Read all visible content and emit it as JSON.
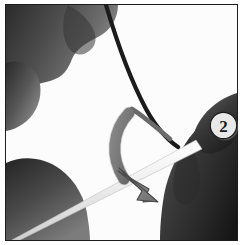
{
  "figure": {
    "kind": "instructional-photograph",
    "alt_text": "Grayscale photo: left hand holds a thin dark wire, right hand grips a light rod; a curved arrow shows the bending direction.",
    "background_color": "#ffffff",
    "frame": {
      "border_color": "#1d1d1d",
      "border_width_px": 1,
      "fill_color": "#fbfbfb"
    }
  },
  "step_badge": {
    "label": "2",
    "shape": "circle",
    "fill_color": "#e8e8e8",
    "outline_color": "#1a1a1a",
    "text_color": "#1a1a1a",
    "shadow_color": "#7d7d7d"
  },
  "direction_arrow": {
    "name": "curved-bend-arrow",
    "style": "curved",
    "sweep": "clockwise",
    "points_toward": "down-right",
    "fill_color": "#8c8c8c",
    "outline_color": "#4a4a4a"
  },
  "objects": [
    {
      "name": "left-hand",
      "tone": "dark-gray",
      "fill_color": "#3a3a3a",
      "position": "upper-left"
    },
    {
      "name": "left-thumb",
      "tone": "dark-gray",
      "fill_color": "#4b4b4b",
      "position": "lower-left"
    },
    {
      "name": "right-hand",
      "tone": "dark-gray",
      "fill_color": "#2f2f2f",
      "position": "lower-right"
    },
    {
      "name": "wire",
      "tone": "near-black",
      "fill_color": "#1c1c1c",
      "description": "thin dark wire descending from top"
    },
    {
      "name": "rod",
      "tone": "white",
      "fill_color": "#f4f4f4",
      "description": "light diagonal rod from lower-left to upper-right"
    }
  ]
}
